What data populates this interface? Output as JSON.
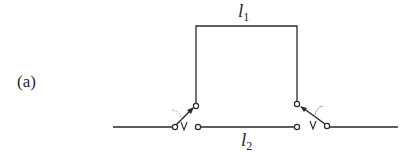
{
  "diagram": {
    "panel_label": "(a)",
    "path_1": {
      "symbol": "l",
      "subscript": "1"
    },
    "path_2": {
      "symbol": "l",
      "subscript": "2"
    },
    "colors": {
      "line": "#2a2a2a",
      "background": "#ffffff",
      "arc": "#9a9a9a"
    }
  }
}
